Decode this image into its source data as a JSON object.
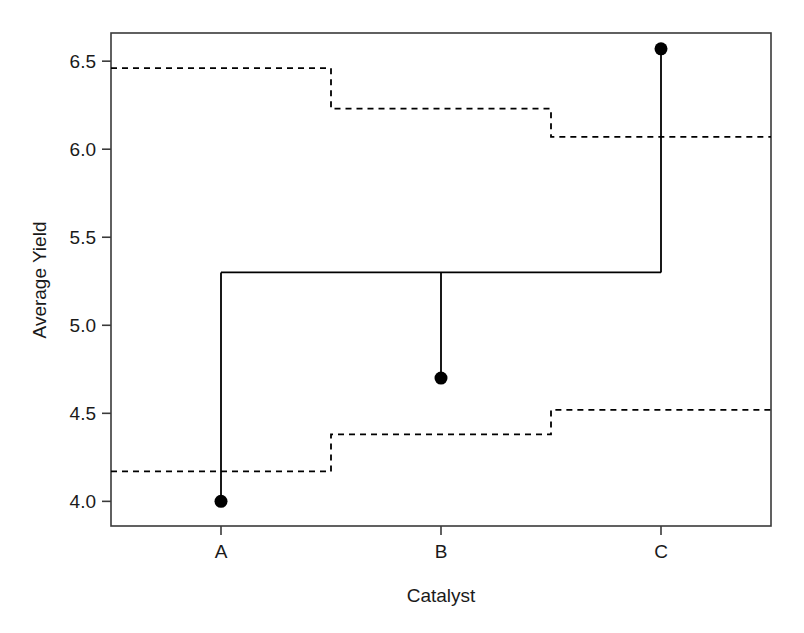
{
  "chart_data": {
    "type": "line",
    "title": "",
    "xlabel": "Catalyst",
    "ylabel": "Average Yield",
    "categories": [
      "A",
      "B",
      "C"
    ],
    "x_tick_labels": [
      "A",
      "B",
      "C"
    ],
    "y_tick_labels": [
      "4.0",
      "4.5",
      "5.0",
      "5.5",
      "6.0",
      "6.5"
    ],
    "y_tick_values": [
      4.0,
      4.5,
      5.0,
      5.5,
      6.0,
      6.5
    ],
    "ylim": [
      3.86,
      6.66
    ],
    "xlim": [
      0.5,
      3.5
    ],
    "grid": false,
    "legend": false,
    "series": [
      {
        "name": "Average Yield",
        "style": "points",
        "marker": "filled-circle",
        "color": "#000000",
        "categories": [
          "A",
          "B",
          "C"
        ],
        "values": [
          4.0,
          4.7,
          6.57
        ]
      },
      {
        "name": "Overall mean (solid step)",
        "style": "step-solid",
        "color": "#000000",
        "categories": [
          "A",
          "B",
          "C"
        ],
        "values": [
          5.3,
          5.3,
          5.3
        ]
      },
      {
        "name": "Upper decision limit (dashed step)",
        "style": "step-dashed",
        "color": "#000000",
        "categories": [
          "A",
          "B",
          "C"
        ],
        "values": [
          6.46,
          6.23,
          6.07
        ]
      },
      {
        "name": "Lower decision limit (dashed step)",
        "style": "step-dashed",
        "color": "#000000",
        "categories": [
          "A",
          "B",
          "C"
        ],
        "values": [
          4.17,
          4.38,
          4.52
        ]
      }
    ],
    "annotations": []
  },
  "axes": {
    "y_title": "Average Yield",
    "x_title": "Catalyst",
    "y_ticks": [
      {
        "label": "6.5",
        "value": 6.5
      },
      {
        "label": "6.0",
        "value": 6.0
      },
      {
        "label": "5.5",
        "value": 5.5
      },
      {
        "label": "5.0",
        "value": 5.0
      },
      {
        "label": "4.5",
        "value": 4.5
      },
      {
        "label": "4.0",
        "value": 4.0
      }
    ],
    "x_ticks": [
      {
        "label": "A",
        "value": 1
      },
      {
        "label": "B",
        "value": 2
      },
      {
        "label": "C",
        "value": 3
      }
    ]
  },
  "style": {
    "frame_color": "#3a3a3a",
    "line_color": "#1a1a1a",
    "marker_color": "#000000",
    "background": "#ffffff"
  }
}
